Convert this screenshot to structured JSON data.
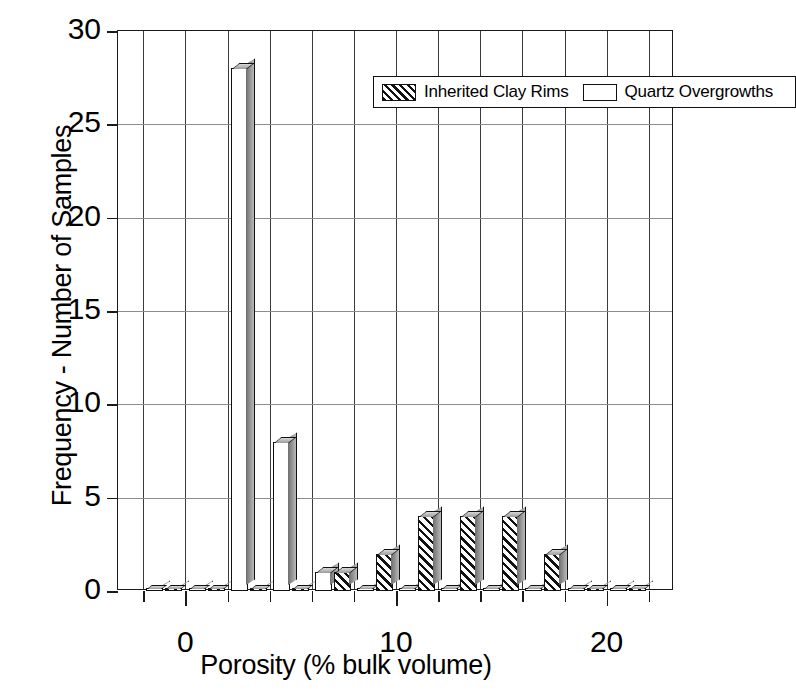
{
  "chart_data": {
    "type": "bar",
    "title": "",
    "subtitle": "",
    "xlabel": "Porosity (% bulk volume)",
    "ylabel": "Frequency - Number of Samples",
    "xlim": [
      -3.2,
      23.2
    ],
    "ylim": [
      0,
      30
    ],
    "xticks": [
      -2,
      0,
      2,
      4,
      6,
      8,
      10,
      12,
      14,
      16,
      18,
      20,
      22
    ],
    "xticklabels": [
      "",
      "0",
      "",
      "",
      "",
      "",
      "10",
      "",
      "",
      "",
      "",
      "20",
      ""
    ],
    "yticks": [
      0,
      5,
      10,
      15,
      20,
      25,
      30
    ],
    "yticklabels": [
      "0",
      "5",
      "10",
      "15",
      "20",
      "25",
      "30"
    ],
    "grid": "both",
    "legend_position": "top-center",
    "bin_width": 2,
    "series": [
      {
        "name": "Quartz Overgrowths",
        "fill": "white",
        "x": [
          -1,
          1,
          3,
          5,
          7,
          9,
          11,
          13,
          15,
          17,
          19,
          21
        ],
        "values": [
          0,
          0,
          28,
          8,
          1,
          0,
          0,
          0,
          0,
          0,
          0,
          0
        ]
      },
      {
        "name": "Inherited Clay Rims",
        "fill": "hatched",
        "x": [
          -1,
          1,
          3,
          5,
          7,
          9,
          11,
          13,
          15,
          17,
          19,
          21
        ],
        "values": [
          0,
          0,
          0,
          0,
          1,
          2,
          4,
          4,
          4,
          2,
          0,
          0
        ]
      }
    ]
  },
  "legend": {
    "items": [
      {
        "label": "Inherited Clay Rims",
        "fill": "hatched"
      },
      {
        "label": "Quartz Overgrowths",
        "fill": "white"
      }
    ]
  },
  "axes": {
    "ylabel_text": "Frequency - Number of Samples",
    "xlabel_text": "Porosity (% bulk volume)",
    "y_tick_labels": [
      "0",
      "5",
      "10",
      "15",
      "20",
      "25",
      "30"
    ],
    "x_tick_labels": [
      "0",
      "10",
      "20"
    ]
  },
  "colors": {
    "axis": "#1a1a1a",
    "vgrid": "#3a3a3a",
    "hgrid": "#8d8d8d",
    "bar_fill": "#ffffff",
    "bar_hatch": "#111111",
    "background": "#ffffff"
  }
}
